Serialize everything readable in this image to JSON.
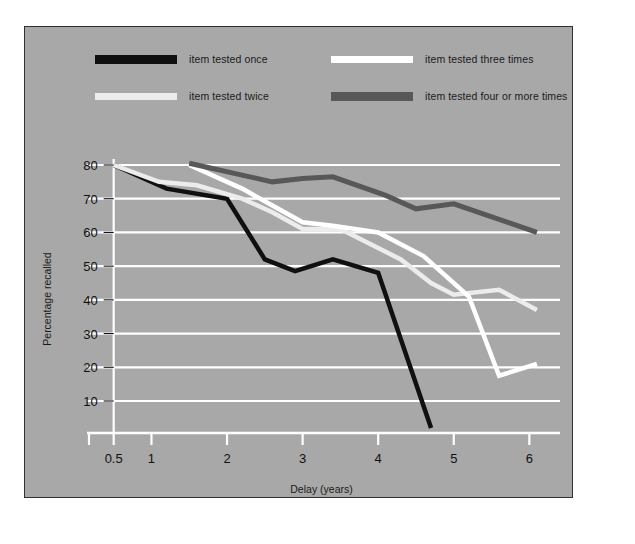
{
  "figure": {
    "background": "#ffffff",
    "panel_color": "#a8a8a8",
    "panel_border": "#2e3033",
    "grid_color": "#ffffff"
  },
  "legend": {
    "items": [
      {
        "label": "item tested once",
        "color": "#101010",
        "weight": "thick",
        "row": 0,
        "col": 0
      },
      {
        "label": "item tested three times",
        "color": "#ffffff",
        "weight": "normal",
        "row": 0,
        "col": 1
      },
      {
        "label": "item tested twice",
        "color": "#ececec",
        "weight": "normal",
        "row": 1,
        "col": 0
      },
      {
        "label": "item tested four or more times",
        "color": "#585858",
        "weight": "thick",
        "row": 1,
        "col": 1
      }
    ]
  },
  "chart_data": {
    "type": "line",
    "title": "",
    "xlabel": "Delay (years)",
    "ylabel": "Percentage recalled",
    "xlim": [
      0.2,
      6.3
    ],
    "ylim": [
      0,
      85
    ],
    "xticks": [
      0.5,
      1,
      2,
      3,
      4,
      5,
      6
    ],
    "xtick_labels": [
      "0.5",
      "1",
      "2",
      "3",
      "4",
      "5",
      "6"
    ],
    "yticks": [
      10,
      20,
      30,
      40,
      50,
      60,
      70,
      80
    ],
    "ytick_labels": [
      "10",
      "20",
      "30",
      "40",
      "50",
      "60",
      "70",
      "80"
    ],
    "grid": "horizontal",
    "legend_position": "above-plot",
    "series": [
      {
        "name": "item tested once",
        "color": "#101010",
        "width": 4.5,
        "x": [
          0.5,
          1.2,
          2.0,
          2.5,
          2.9,
          3.4,
          4.0,
          4.7
        ],
        "y": [
          80,
          73,
          70,
          52,
          48.5,
          52,
          48,
          2
        ]
      },
      {
        "name": "item tested twice",
        "color": "#ececec",
        "width": 4.5,
        "x": [
          0.5,
          1.1,
          1.6,
          2.2,
          2.6,
          3.0,
          3.5,
          4.3,
          4.7,
          5.0,
          5.6,
          6.1
        ],
        "y": [
          80,
          75,
          74,
          70,
          66,
          61,
          61,
          52,
          45,
          41.5,
          43,
          37
        ]
      },
      {
        "name": "item tested three times",
        "color": "#ffffff",
        "width": 4.5,
        "x": [
          1.5,
          2.2,
          2.6,
          3.0,
          3.4,
          4.0,
          4.6,
          5.2,
          5.6,
          6.1
        ],
        "y": [
          80,
          73,
          68,
          63,
          62,
          60,
          53,
          41,
          17.5,
          21
        ]
      },
      {
        "name": "item tested four or more times",
        "color": "#585858",
        "width": 5,
        "x": [
          1.5,
          2.2,
          2.6,
          3.0,
          3.4,
          4.1,
          4.5,
          5.0,
          6.1
        ],
        "y": [
          80.5,
          77,
          75,
          76,
          76.5,
          71,
          67,
          68.5,
          60
        ]
      }
    ]
  }
}
